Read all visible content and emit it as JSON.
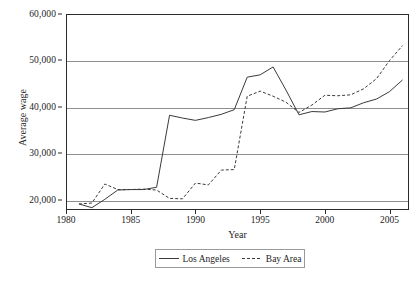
{
  "chart_data": {
    "type": "line",
    "title": "",
    "xlabel": "Year",
    "ylabel": "Average wage",
    "xlim": [
      1980,
      2006.5
    ],
    "ylim": [
      17800,
      60000
    ],
    "grid": "horizontal",
    "legend_position": "bottom-center",
    "xticks": [
      "1980",
      "1985",
      "1990",
      "1995",
      "2000",
      "2005"
    ],
    "xtick_values": [
      1980,
      1985,
      1990,
      1995,
      2000,
      2005
    ],
    "yticks": [
      "20,000",
      "30,000",
      "40,000",
      "50,000",
      "60,000"
    ],
    "ytick_values": [
      20000,
      30000,
      40000,
      50000,
      60000
    ],
    "x": [
      1981,
      1982,
      1983,
      1984,
      1985,
      1986,
      1987,
      1988,
      1989,
      1990,
      1991,
      1992,
      1993,
      1994,
      1995,
      1996,
      1997,
      1998,
      1999,
      2000,
      2001,
      2002,
      2003,
      2004,
      2005,
      2006
    ],
    "series": [
      {
        "name": "Los Angeles",
        "style": "solid",
        "color": "#3a3a3a",
        "values": [
          19100,
          18300,
          20100,
          22100,
          22200,
          22200,
          22700,
          38200,
          37600,
          37100,
          37700,
          38400,
          39400,
          46400,
          46900,
          48600,
          43600,
          38300,
          39000,
          38900,
          39600,
          39800,
          40900,
          41700,
          43300,
          45800
        ]
      },
      {
        "name": "Bay Area",
        "style": "dashed",
        "color": "#3a3a3a",
        "values": [
          19100,
          19300,
          23400,
          22200,
          22200,
          22300,
          22100,
          20300,
          20200,
          23600,
          23200,
          26400,
          26500,
          42300,
          43400,
          42300,
          41000,
          38800,
          40400,
          42500,
          42400,
          42600,
          43900,
          46100,
          50000,
          53200
        ]
      }
    ]
  },
  "axes": {
    "y_title": "Average wage",
    "x_title": "Year"
  },
  "legend": {
    "entries": [
      {
        "label": "Los Angeles",
        "style": "solid"
      },
      {
        "label": "Bay Area",
        "style": "dashed"
      }
    ]
  }
}
